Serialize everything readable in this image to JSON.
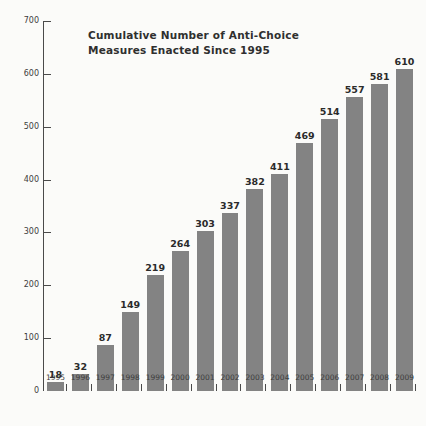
{
  "chart_data": {
    "type": "bar",
    "title": "Cumulative Number of Anti-Choice Measures Enacted Since 1995",
    "title_lines": [
      "Cumulative Number of Anti-Choice",
      "Measures Enacted Since 1995"
    ],
    "xlabel": "",
    "ylabel": "",
    "categories": [
      "1995",
      "1996",
      "1997",
      "1998",
      "1999",
      "2000",
      "2001",
      "2002",
      "2003",
      "2004",
      "2005",
      "2006",
      "2007",
      "2008",
      "2009"
    ],
    "values": [
      18,
      32,
      87,
      149,
      219,
      264,
      303,
      337,
      382,
      411,
      469,
      514,
      557,
      581,
      610
    ],
    "data_labels": [
      "18",
      "32",
      "87",
      "149",
      "219",
      "264",
      "303",
      "337",
      "382",
      "411",
      "469",
      "514",
      "557",
      "581",
      "610"
    ],
    "ylim": [
      0,
      700
    ],
    "ytick_values": [
      0,
      100,
      200,
      300,
      400,
      500,
      600,
      700
    ],
    "ytick_labels": [
      "0",
      "100",
      "200",
      "300",
      "400",
      "500",
      "600",
      "700"
    ],
    "grid": false,
    "legend": null,
    "legend_position": "none",
    "series": [
      {
        "name": "Cumulative anti-choice measures enacted",
        "values": [
          18,
          32,
          87,
          149,
          219,
          264,
          303,
          337,
          382,
          411,
          469,
          514,
          557,
          581,
          610
        ]
      }
    ],
    "colors": {
      "bar": "#838383",
      "axis": "#4a4a4a",
      "text": "#3d3d3d",
      "title": "#2f2f2f",
      "background": "#fbfbf9"
    }
  }
}
